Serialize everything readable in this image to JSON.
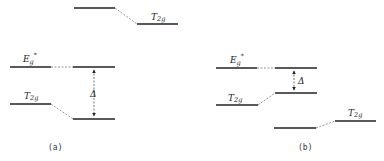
{
  "figure": {
    "panels": [
      {
        "id": "a",
        "label": "(a)",
        "levels": [
          {
            "name": "T2g (upper ligand)",
            "label": "T2g"
          },
          {
            "name": "Eg*",
            "label": "Eg*"
          },
          {
            "name": "T2g (lower)",
            "label": "T2g"
          }
        ],
        "gap_label": "Δ"
      },
      {
        "id": "b",
        "label": "(b)",
        "levels": [
          {
            "name": "Eg*",
            "label": "Eg*"
          },
          {
            "name": "T2g (upper)",
            "label": "T2g"
          },
          {
            "name": "T2g (lower ligand)",
            "label": "T2g"
          }
        ],
        "gap_label": "Δ"
      }
    ],
    "text": {
      "t2g_base": "T",
      "t2g_sub": "2g",
      "eg_base": "E",
      "eg_sub": "g",
      "eg_sup": "*",
      "delta": "Δ",
      "label_a": "(a)",
      "label_b": "(b)"
    }
  }
}
